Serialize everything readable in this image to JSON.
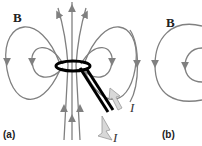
{
  "panels": [
    {
      "id": "a",
      "caption": "(a)",
      "field_label": "B",
      "current_labels": [
        "I",
        "I"
      ]
    },
    {
      "id": "b",
      "caption": "(b)",
      "field_label": "B"
    }
  ],
  "colors": {
    "field_lines": "#808080",
    "wire": "#000000",
    "current_arrow": "#d8d8d8"
  }
}
